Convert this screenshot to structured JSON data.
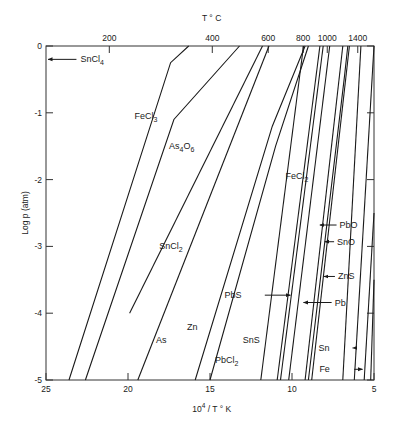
{
  "chart_data": {
    "type": "line",
    "title": "",
    "xlabel": "10^4 / T K",
    "xlabel_parts": {
      "base": "10",
      "sup": "4",
      "rest": " / T ° K"
    },
    "ylabel": "Log p (atm)",
    "top_axis_label": "T ° C",
    "xlim": [
      25,
      5
    ],
    "ylim": [
      -5,
      0
    ],
    "x_ticks": [
      25,
      20,
      15,
      10,
      5
    ],
    "y_ticks": [
      0,
      -1,
      -2,
      -3,
      -4,
      -5
    ],
    "top_ticks": [
      {
        "label": "200",
        "x": 21.14
      },
      {
        "label": "400",
        "x": 14.86
      },
      {
        "label": "600",
        "x": 11.45
      },
      {
        "label": "800",
        "x": 9.32
      },
      {
        "label": "1000",
        "x": 7.85
      },
      {
        "label": "1400",
        "x": 5.99
      }
    ],
    "grid": false,
    "legend": "none (inline labels)",
    "series": [
      {
        "name": "SnCl4",
        "label": "SnCl",
        "sub": "4",
        "points": [
          [
            25.0,
            -0.2
          ]
        ],
        "arrow": true,
        "label_at": [
          22.9,
          -0.2
        ]
      },
      {
        "name": "FeCl3",
        "label": "FeCl",
        "sub": "3",
        "points": [
          [
            23.6,
            -5.0
          ],
          [
            17.4,
            -0.25
          ],
          [
            16.3,
            0.0
          ]
        ],
        "label_at": [
          19.6,
          -1.05
        ]
      },
      {
        "name": "As4O6",
        "label": "As",
        "sub": "4",
        "label2": "O",
        "sub2": "6",
        "points": [
          [
            22.6,
            -5.0
          ],
          [
            17.2,
            -1.1
          ],
          [
            13.2,
            0.0
          ]
        ],
        "label_at": [
          17.5,
          -1.5
        ]
      },
      {
        "name": "SnCl2",
        "label": "SnCl",
        "sub": "2",
        "points": [
          [
            19.9,
            -4.0
          ],
          [
            11.8,
            0.0
          ]
        ],
        "label_at": [
          18.1,
          -3.0
        ]
      },
      {
        "name": "As",
        "label": "As",
        "points": [
          [
            19.4,
            -5.0
          ],
          [
            11.4,
            0.0
          ]
        ],
        "label_at": [
          18.3,
          -4.4
        ]
      },
      {
        "name": "Zn",
        "label": "Zn",
        "points": [
          [
            15.9,
            -5.0
          ],
          [
            11.2,
            -1.2
          ],
          [
            9.2,
            0.0
          ]
        ],
        "label_at": [
          16.4,
          -4.2
        ]
      },
      {
        "name": "PbCl2",
        "label": "PbCl",
        "sub": "2",
        "points": [
          [
            15.0,
            -5.0
          ],
          [
            11.0,
            -1.5
          ],
          [
            9.0,
            0.0
          ]
        ],
        "label_at": [
          14.7,
          -4.7
        ]
      },
      {
        "name": "SnS",
        "label": "SnS",
        "points": [
          [
            11.9,
            -5.0
          ],
          [
            9.3,
            0.0
          ]
        ],
        "label_at": [
          13.0,
          -4.4
        ]
      },
      {
        "name": "FeCl2",
        "label": "FeCl",
        "sub": "2",
        "points": [
          [
            10.9,
            -5.0
          ],
          [
            8.3,
            0.0
          ]
        ],
        "label_at": [
          10.4,
          -1.95
        ]
      },
      {
        "name": "PbS",
        "label": "PbS",
        "points": [
          [
            10.7,
            -5.0
          ],
          [
            8.1,
            0.0
          ]
        ],
        "arrow": true,
        "arrow_to": [
          10.1,
          -3.73
        ],
        "label_at": [
          13.0,
          -3.73
        ]
      },
      {
        "name": "Pb",
        "label": "Pb",
        "points": [
          [
            10.2,
            -5.0
          ],
          [
            7.7,
            0.0
          ]
        ],
        "arrow": true,
        "arrow_to": [
          9.3,
          -3.84
        ],
        "label_at": [
          7.4,
          -3.84
        ]
      },
      {
        "name": "PbO",
        "label": "PbO",
        "points": [
          [
            9.2,
            -5.0
          ],
          [
            6.9,
            0.0
          ]
        ],
        "arrow": true,
        "arrow_to": [
          8.3,
          -2.68
        ],
        "label_at": [
          7.1,
          -2.68
        ]
      },
      {
        "name": "SnO",
        "label": "SnO",
        "points": [
          [
            9.0,
            -5.0
          ],
          [
            6.8,
            -0.45
          ],
          [
            6.6,
            0.0
          ]
        ],
        "arrow": true,
        "arrow_to": [
          8.0,
          -2.93
        ],
        "label_at": [
          7.25,
          -2.93
        ]
      },
      {
        "name": "ZnS",
        "label": "ZnS",
        "points": [
          [
            8.8,
            -5.0
          ],
          [
            6.5,
            0.0
          ]
        ],
        "arrow": true,
        "arrow_to": [
          8.05,
          -3.45
        ],
        "label_at": [
          7.2,
          -3.45
        ]
      },
      {
        "name": "Sn",
        "label": "Sn",
        "points": [
          [
            6.9,
            -5.0
          ],
          [
            5.8,
            0.0
          ]
        ],
        "arrow": true,
        "arrow_to": [
          6.3,
          -4.52
        ],
        "label_at": [
          7.6,
          -4.52
        ]
      },
      {
        "name": "Fe",
        "label": "Fe",
        "points": [
          [
            6.2,
            -5.0
          ],
          [
            5.0,
            0.0
          ]
        ],
        "arrow": true,
        "arrow_to": [
          5.7,
          -4.84
        ],
        "label_at": [
          7.55,
          -4.84
        ]
      },
      {
        "name": "unlabeled-1",
        "label": "",
        "points": [
          [
            5.6,
            -5.0
          ],
          [
            5.0,
            -2.5
          ]
        ]
      },
      {
        "name": "unlabeled-2",
        "label": "",
        "points": [
          [
            5.2,
            -5.0
          ],
          [
            5.0,
            -3.5
          ]
        ]
      }
    ]
  }
}
